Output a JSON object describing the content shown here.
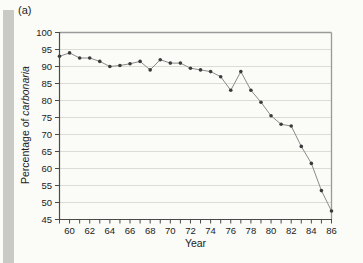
{
  "figure": {
    "panel_label": "(a)"
  },
  "chart_data": {
    "type": "line",
    "title": "",
    "xlabel": "Year",
    "ylabel": "Percentage of carbonaria",
    "ylabel_regular": "Percentage of ",
    "ylabel_italic": "carbonaria",
    "xlim": [
      59,
      86
    ],
    "ylim": [
      45,
      100
    ],
    "x": [
      59,
      60,
      61,
      62,
      63,
      64,
      65,
      66,
      67,
      68,
      69,
      70,
      71,
      72,
      73,
      74,
      75,
      76,
      77,
      78,
      79,
      80,
      81,
      82,
      83,
      84,
      85,
      86
    ],
    "series": [
      {
        "name": "percentage of carbonaria",
        "values": [
          93,
          94,
          92.5,
          92.5,
          91.5,
          90,
          90.3,
          90.8,
          91.5,
          89,
          92,
          91,
          91,
          89.5,
          89,
          88.5,
          87,
          83,
          88.5,
          83,
          79.5,
          75.5,
          73,
          72.5,
          66.5,
          61.5,
          53.5,
          47.5
        ]
      }
    ],
    "x_tick_step": 1,
    "x_label_years": [
      60,
      62,
      64,
      66,
      68,
      70,
      72,
      74,
      76,
      78,
      80,
      82,
      84,
      86
    ],
    "y_ticks": [
      45,
      50,
      55,
      60,
      65,
      70,
      75,
      80,
      85,
      90,
      95,
      100
    ],
    "y_gridlines": [
      50,
      55,
      60,
      65,
      70,
      75,
      80,
      85,
      90,
      95
    ],
    "grid": "horizontal",
    "legend": "none",
    "colors": {
      "line": "#8a8a8a",
      "marker": "#3b3b3b",
      "grid": "#dcdcd7",
      "axis_dark": "#4a4a4a",
      "axis_light": "#9a9a9a",
      "tick_text": "#222222",
      "band": "#c9c9c6",
      "page_bg": "#fbfbf7"
    }
  }
}
